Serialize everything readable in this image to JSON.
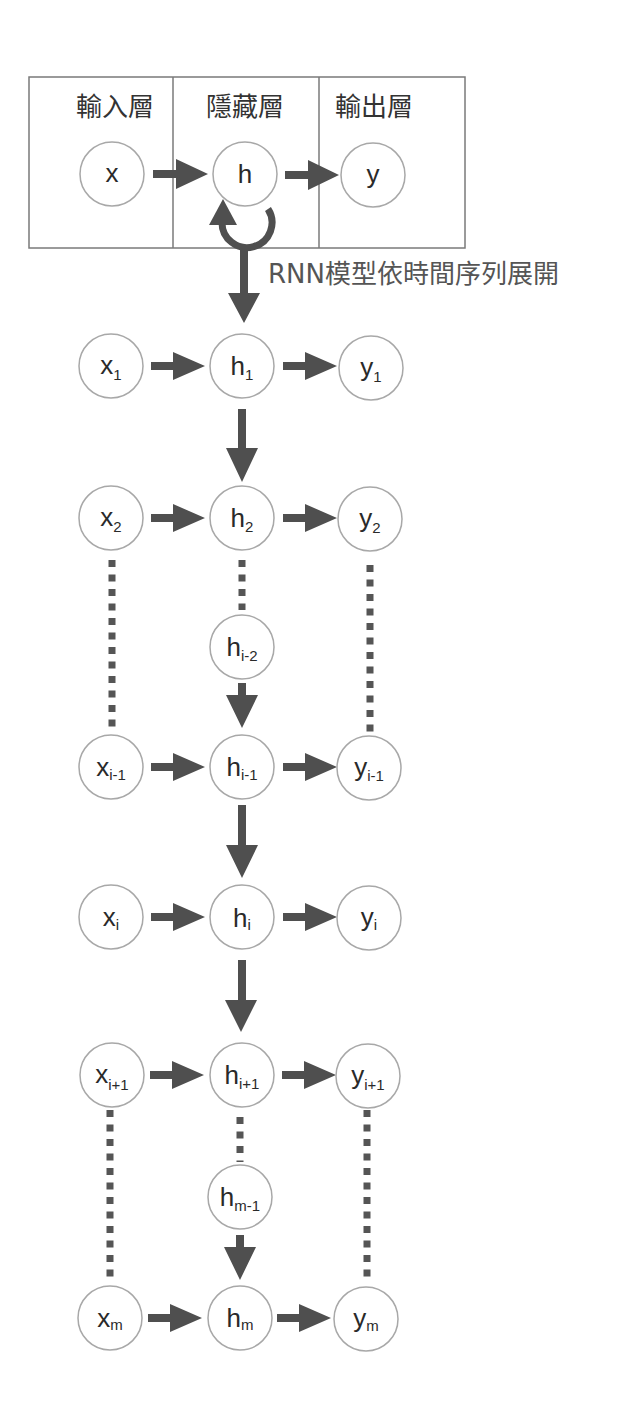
{
  "frame": {
    "headers": {
      "input": "輸入層",
      "hidden": "隱藏層",
      "output": "輸出層"
    }
  },
  "folded": {
    "x": "x",
    "h": "h",
    "y": "y"
  },
  "unroll_label": "RNN模型依時間序列展開",
  "rows": [
    {
      "x": {
        "base": "x",
        "sub": "1"
      },
      "h": {
        "base": "h",
        "sub": "1"
      },
      "y": {
        "base": "y",
        "sub": "1"
      }
    },
    {
      "x": {
        "base": "x",
        "sub": "2"
      },
      "h": {
        "base": "h",
        "sub": "2"
      },
      "y": {
        "base": "y",
        "sub": "2"
      }
    },
    {
      "x": {
        "base": "x",
        "sub": "i-1"
      },
      "h": {
        "base": "h",
        "sub": "i-1"
      },
      "y": {
        "base": "y",
        "sub": "i-1"
      }
    },
    {
      "x": {
        "base": "x",
        "sub": "i"
      },
      "h": {
        "base": "h",
        "sub": "i"
      },
      "y": {
        "base": "y",
        "sub": "i"
      }
    },
    {
      "x": {
        "base": "x",
        "sub": "i+1"
      },
      "h": {
        "base": "h",
        "sub": "i+1"
      },
      "y": {
        "base": "y",
        "sub": "i+1"
      }
    },
    {
      "x": {
        "base": "x",
        "sub": "m"
      },
      "h": {
        "base": "h",
        "sub": "m"
      },
      "y": {
        "base": "y",
        "sub": "m"
      }
    }
  ],
  "intermediate_hidden": [
    {
      "base": "h",
      "sub": "i-2"
    },
    {
      "base": "h",
      "sub": "m-1"
    }
  ],
  "colors": {
    "arrow": "#4f4f4f",
    "node_stroke": "#a8a8a8",
    "frame": "#7a7a7a",
    "text": "#2a2a2a"
  }
}
